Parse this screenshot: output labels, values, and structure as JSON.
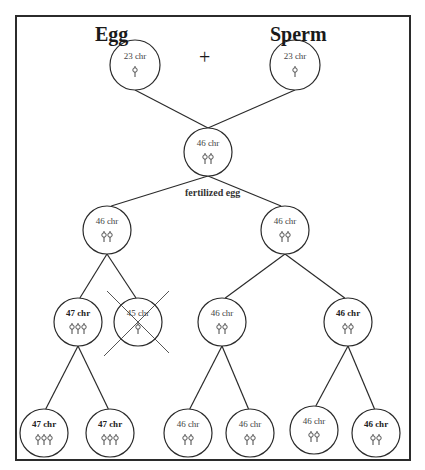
{
  "diagram": {
    "titles": {
      "egg": "Egg",
      "sperm": "Sperm",
      "plus": "+"
    },
    "zygote_label": "fertilized egg",
    "colors": {
      "line": "#2b2b2b",
      "frame": "#2b2b2b",
      "text": "#1a1a1a"
    },
    "cells": [
      {
        "id": "egg",
        "label": "23 chr",
        "chromosomes": 1,
        "cx": 135,
        "cy": 65,
        "r": 25
      },
      {
        "id": "sperm",
        "label": "23 chr",
        "chromosomes": 1,
        "cx": 295,
        "cy": 65,
        "r": 25
      },
      {
        "id": "zygote",
        "label": "46 chr",
        "chromosomes": 2,
        "cx": 208,
        "cy": 152,
        "r": 24
      },
      {
        "id": "gen1-left",
        "label": "46 chr",
        "chromosomes": 2,
        "cx": 107,
        "cy": 230,
        "r": 24
      },
      {
        "id": "gen1-right",
        "label": "46 chr",
        "chromosomes": 2,
        "cx": 285,
        "cy": 230,
        "r": 24
      },
      {
        "id": "gen2-a",
        "label": "47 chr",
        "chromosomes": 3,
        "cx": 78,
        "cy": 322,
        "r": 24
      },
      {
        "id": "gen2-b",
        "label": "45 chr",
        "chromosomes": 1,
        "cx": 138,
        "cy": 322,
        "r": 24,
        "crossed_out": true
      },
      {
        "id": "gen2-c",
        "label": "46 chr",
        "chromosomes": 2,
        "cx": 222,
        "cy": 322,
        "r": 24
      },
      {
        "id": "gen2-d",
        "label": "46 chr",
        "chromosomes": 2,
        "cx": 348,
        "cy": 322,
        "r": 24
      },
      {
        "id": "gen3-a",
        "label": "47 chr",
        "chromosomes": 3,
        "cx": 44,
        "cy": 433,
        "r": 24
      },
      {
        "id": "gen3-b",
        "label": "47 chr",
        "chromosomes": 3,
        "cx": 110,
        "cy": 433,
        "r": 24
      },
      {
        "id": "gen3-c",
        "label": "46 chr",
        "chromosomes": 2,
        "cx": 188,
        "cy": 433,
        "r": 24
      },
      {
        "id": "gen3-d",
        "label": "46 chr",
        "chromosomes": 2,
        "cx": 250,
        "cy": 433,
        "r": 24
      },
      {
        "id": "gen3-e",
        "label": "46 chr",
        "chromosomes": 2,
        "cx": 314,
        "cy": 430,
        "r": 24
      },
      {
        "id": "gen3-f",
        "label": "46 chr",
        "chromosomes": 2,
        "cx": 376,
        "cy": 433,
        "r": 24
      }
    ],
    "edges": [
      [
        "egg",
        "zygote"
      ],
      [
        "sperm",
        "zygote"
      ],
      [
        "zygote",
        "gen1-left"
      ],
      [
        "zygote",
        "gen1-right"
      ],
      [
        "gen1-left",
        "gen2-a"
      ],
      [
        "gen1-left",
        "gen2-b"
      ],
      [
        "gen1-right",
        "gen2-c"
      ],
      [
        "gen1-right",
        "gen2-d"
      ],
      [
        "gen2-a",
        "gen3-a"
      ],
      [
        "gen2-a",
        "gen3-b"
      ],
      [
        "gen2-c",
        "gen3-c"
      ],
      [
        "gen2-c",
        "gen3-d"
      ],
      [
        "gen2-d",
        "gen3-e"
      ],
      [
        "gen2-d",
        "gen3-f"
      ]
    ]
  }
}
